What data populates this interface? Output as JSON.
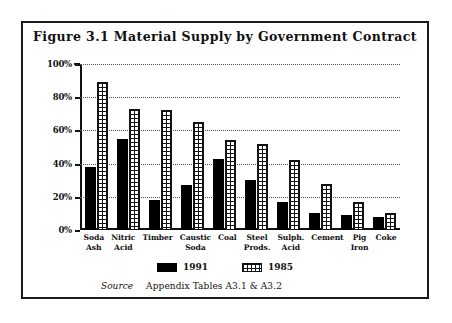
{
  "figure": {
    "title": "Figure 3.1  Material Supply by Government Contract",
    "source_label": "Source",
    "source_text": "Appendix Tables A3.1 & A3.2"
  },
  "legend": {
    "items": [
      {
        "label": "1991",
        "pattern": "solid-black",
        "color": "#000000"
      },
      {
        "label": "1985",
        "pattern": "cross-hatch-grid",
        "color": "#ffffff"
      }
    ]
  },
  "axis": {
    "yticks": [
      "0%",
      "20%",
      "40%",
      "60%",
      "80%",
      "100%"
    ]
  },
  "chart_data": {
    "type": "bar",
    "title": "Figure 3.1  Material Supply by Government Contract",
    "xlabel": "",
    "ylabel": "",
    "ylim": [
      0,
      100
    ],
    "yticks": [
      0,
      20,
      40,
      60,
      80,
      100
    ],
    "ytick_labels": [
      "0%",
      "20%",
      "40%",
      "60%",
      "80%",
      "100%"
    ],
    "grid": true,
    "legend_position": "bottom-center",
    "categories": [
      "Soda\nAsh",
      "Nitric\nAcid",
      "Timber",
      "Caustic\nSoda",
      "Coal",
      "Steel\nProds.",
      "Sulph.\nAcid",
      "Cement",
      "Pig\nIron",
      "Coke"
    ],
    "series": [
      {
        "name": "1991",
        "values": [
          38,
          55,
          18,
          27,
          43,
          30,
          17,
          10,
          9,
          8
        ]
      },
      {
        "name": "1985",
        "values": [
          89,
          73,
          72,
          65,
          54,
          52,
          42,
          28,
          17,
          10
        ]
      }
    ]
  }
}
